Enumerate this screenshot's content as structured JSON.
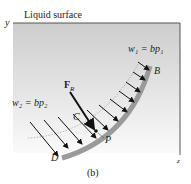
{
  "figure": {
    "surface_label": "Liquid surface",
    "y_axis": "y",
    "z_axis": "z",
    "w1_label": "w₁ = bp₁",
    "w2_label": "w₂ = bp₂",
    "force_label": "F",
    "force_sub": "R",
    "point_B": "B",
    "point_C": "C",
    "point_D": "D",
    "point_P": "P",
    "caption": "(b)",
    "colors": {
      "plate": "#9a9a9a",
      "fill_top": "#cfcfcf",
      "fill_bottom": "#f7f7f7",
      "frame": "#555555"
    }
  }
}
